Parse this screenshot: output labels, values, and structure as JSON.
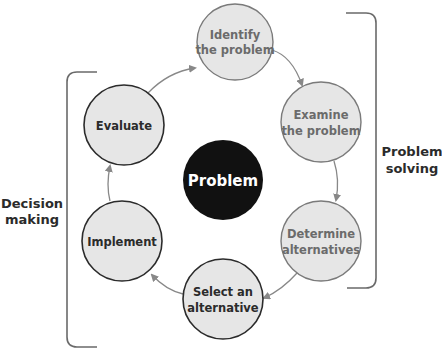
{
  "diagram": {
    "center": {
      "label": "Problem",
      "fill": "#111111",
      "text_color": "#ffffff"
    },
    "nodes": [
      {
        "id": "identify",
        "lines": [
          "Identify",
          "the problem"
        ],
        "group": "problem-solving"
      },
      {
        "id": "examine",
        "lines": [
          "Examine",
          "the problem"
        ],
        "group": "problem-solving"
      },
      {
        "id": "determine",
        "lines": [
          "Determine",
          "alternatives"
        ],
        "group": "problem-solving"
      },
      {
        "id": "select",
        "lines": [
          "Select an",
          "alternative"
        ],
        "group": "decision-making"
      },
      {
        "id": "implement",
        "lines": [
          "Implement"
        ],
        "group": "decision-making"
      },
      {
        "id": "evaluate",
        "lines": [
          "Evaluate"
        ],
        "group": "decision-making"
      }
    ],
    "groups": {
      "problem_solving": {
        "lines": [
          "Problem",
          "solving"
        ]
      },
      "decision_making": {
        "lines": [
          "Decision",
          "making"
        ]
      }
    },
    "flow": [
      "identify",
      "examine",
      "determine",
      "select",
      "implement",
      "evaluate",
      "identify"
    ],
    "colors": {
      "node_fill": "#e6e6e6",
      "light_stroke": "#7a7a7a",
      "dark_stroke": "#2b2b2b",
      "light_text": "#6b6b6b",
      "dark_text": "#2b2b2b",
      "arrow": "#888888",
      "bracket": "#6a6a6a"
    }
  }
}
